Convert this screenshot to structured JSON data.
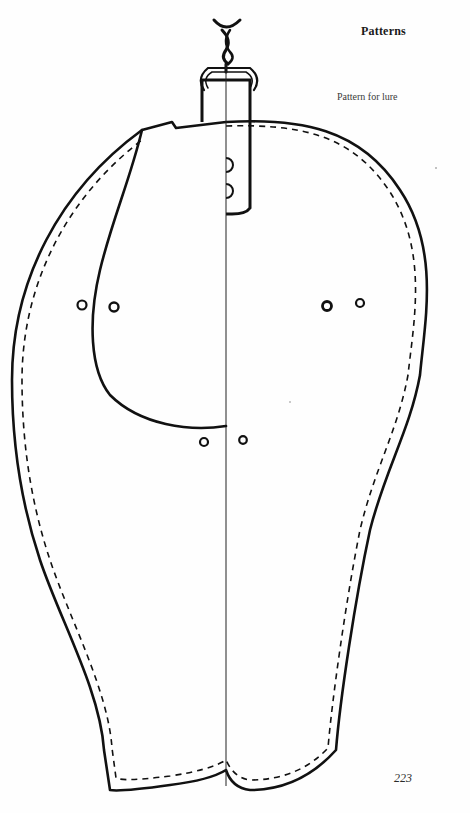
{
  "page": {
    "running_head": "Patterns",
    "caption": "Pattern for lure",
    "page_number": "223"
  },
  "figure": {
    "parts": [
      "swivel-hook",
      "leather-tab-strap",
      "outer-outline",
      "stitch-line",
      "center-fold-line",
      "inner-flap-panel",
      "punch-holes"
    ],
    "ink_color": "#111111",
    "background_color": "#fefefe"
  }
}
